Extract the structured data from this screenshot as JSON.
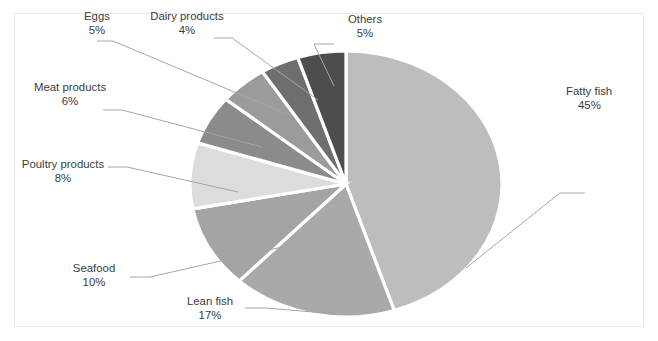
{
  "chart_data": {
    "type": "pie",
    "title": "",
    "subtitle": "",
    "legend_position": "none",
    "grid": false,
    "value_unit": "%",
    "categories": [
      "Fatty fish",
      "Lean fish",
      "Seafood",
      "Poultry products",
      "Meat products",
      "Eggs",
      "Dairy products",
      "Others"
    ],
    "values": [
      45,
      17,
      10,
      8,
      6,
      5,
      4,
      5
    ],
    "labels": [
      "45%",
      "17%",
      "10%",
      "8%",
      "6%",
      "5%",
      "4%",
      "5%"
    ],
    "colors": [
      "#bdbdbd",
      "#a9a9a9",
      "#a4a4a4",
      "#dcdcdc",
      "#8b8b8b",
      "#9b9b9b",
      "#6e6e6e",
      "#4d4d4d"
    ],
    "start_angle_deg": 0,
    "direction": "clockwise",
    "annotations": [
      {
        "name": "Fatty fish",
        "pct": "45%"
      },
      {
        "name": "Lean fish",
        "pct": "17%"
      },
      {
        "name": "Seafood",
        "pct": "10%"
      },
      {
        "name": "Poultry products",
        "pct": "8%"
      },
      {
        "name": "Meat products",
        "pct": "6%"
      },
      {
        "name": "Eggs",
        "pct": "5%"
      },
      {
        "name": "Dairy products",
        "pct": "4%"
      },
      {
        "name": "Others",
        "pct": "5%"
      }
    ]
  },
  "callouts": {
    "fatty_fish": {
      "name": "Fatty fish",
      "pct": "45%"
    },
    "lean_fish": {
      "name": "Lean fish",
      "pct": "17%"
    },
    "seafood": {
      "name": "Seafood",
      "pct": "10%"
    },
    "poultry": {
      "name": "Poultry products",
      "pct": "8%"
    },
    "meat": {
      "name": "Meat products",
      "pct": "6%"
    },
    "eggs": {
      "name": "Eggs",
      "pct": "5%"
    },
    "dairy": {
      "name": "Dairy products",
      "pct": "4%"
    },
    "others": {
      "name": "Others",
      "pct": "5%"
    }
  },
  "style": {
    "background": "#ffffff",
    "frame_border": "#e8e8e8",
    "label_color": "#3c3c3c",
    "leader_color": "#a6a6a6",
    "slice_border": "#ffffff"
  }
}
